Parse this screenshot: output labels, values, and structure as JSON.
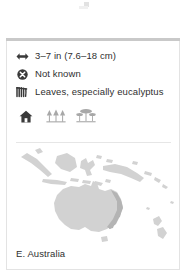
{
  "card": {
    "facts": [
      {
        "icon": "size-arrows-icon",
        "text": "3–7 in (7.6–18 cm)",
        "label": "size"
      },
      {
        "icon": "circle-x-icon",
        "text": "Not known",
        "label": "population"
      },
      {
        "icon": "leaves-icon",
        "text": "Leaves, especially eucalyptus",
        "label": "diet"
      }
    ],
    "habitats": [
      {
        "icon": "house-icon",
        "label": "urban",
        "color": "#3a3a3a"
      },
      {
        "icon": "forest-icon",
        "label": "forest",
        "color": "#a8a8a8"
      },
      {
        "icon": "savanna-icon",
        "label": "savanna",
        "color": "#a8a8a8"
      }
    ],
    "map": {
      "caption": "E. Australia",
      "land_color": "#d2d2d2",
      "range_color": "#b4b4b4",
      "background": "#ffffff"
    },
    "accent": "#c9c9c9",
    "border_color": "#e3e3e3",
    "text_color": "#2f2f2f"
  }
}
